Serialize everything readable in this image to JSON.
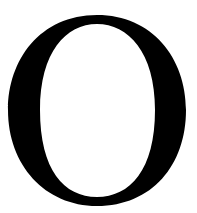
{
  "glyph": {
    "character": "O",
    "color": "#000000",
    "background": "#ffffff",
    "style": "serif"
  }
}
